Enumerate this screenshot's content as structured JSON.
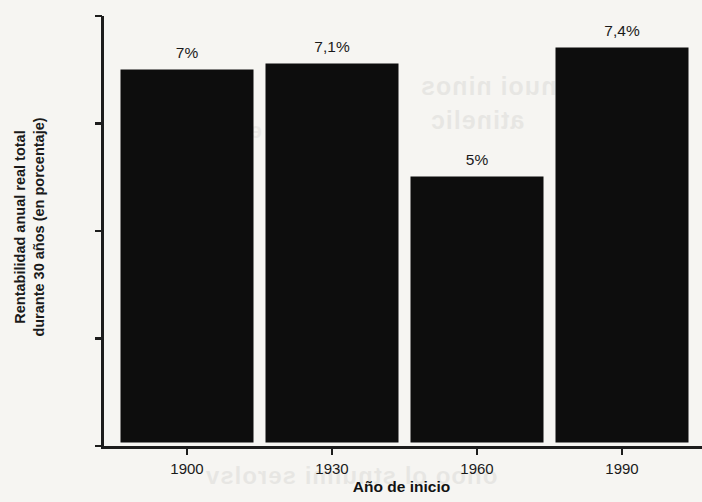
{
  "chart_data": {
    "type": "bar",
    "title": "",
    "subtitle": "",
    "xlabel": "Año de inicio",
    "ylabel": "Rentabilidad anual real total durante 30 años (en porcentaje)",
    "ylabel_line1": "Rentabilidad anual real total",
    "ylabel_line2": "durante 30 años (en porcentaje)",
    "categories": [
      "1900",
      "1930",
      "1960",
      "1990"
    ],
    "values": [
      7,
      7.1,
      5,
      7.4
    ],
    "value_labels": [
      "7%",
      "7,1%",
      "5%",
      "7,4%"
    ],
    "ylim": [
      0,
      8
    ],
    "ytick_values": [
      0,
      2,
      4,
      6,
      8
    ],
    "ytick_labels": [
      "0%",
      "2%",
      "4%",
      "6%",
      "8%"
    ],
    "grid": false,
    "legend": null,
    "bar_color": "#0d0d0d",
    "background_color": "#f6f5f2",
    "axis_color": "#1d1d1d",
    "text_color": "#1a1a1a"
  },
  "artifacts": {
    "bleed_a": "sanuoi ninos",
    "bleed_b": "atinelic",
    "bleed_c": "onoo ol stnulmi serolsv",
    "bleed_d": "ensiqmoo"
  }
}
